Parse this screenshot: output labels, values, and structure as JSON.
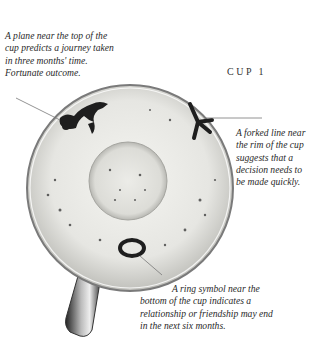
{
  "title": "CUP 1",
  "annotations": [
    {
      "id": "plane",
      "text": "A plane near the top of the cup predicts a journey taken in three months' time. Fortunate outcome."
    },
    {
      "id": "forked-line",
      "text": "A forked line near the rim of the cup suggests that a decision needs to be made quickly."
    },
    {
      "id": "ring",
      "text": "A ring symbol near the bottom of the cup indicates a relationship or friendship may end in the next six months."
    }
  ],
  "colors": {
    "leaves": "#1e1e1e",
    "cup_rim": "#8a8a8a",
    "cup_inner": "#eeeeea",
    "text": "#2a2a2a"
  }
}
